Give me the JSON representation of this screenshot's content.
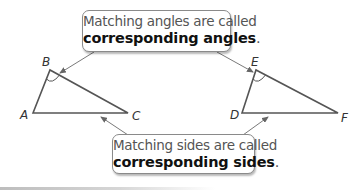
{
  "callouts": {
    "angles": {
      "line1": "Matching angles are called",
      "term": "corresponding angles",
      "punct": "."
    },
    "sides": {
      "line1": "Matching sides are called",
      "term": "corresponding sides",
      "punct": "."
    }
  },
  "triangles": [
    {
      "name": "ABC",
      "vertices": [
        {
          "label": "A",
          "x": 33,
          "y": 113
        },
        {
          "label": "B",
          "x": 50,
          "y": 70
        },
        {
          "label": "C",
          "x": 128,
          "y": 113
        }
      ],
      "marked_angle": "B"
    },
    {
      "name": "DEF",
      "vertices": [
        {
          "label": "D",
          "x": 242,
          "y": 113
        },
        {
          "label": "E",
          "x": 256,
          "y": 70
        },
        {
          "label": "F",
          "x": 338,
          "y": 113
        }
      ],
      "marked_angle": "E"
    }
  ],
  "labels": {
    "A": "A",
    "B": "B",
    "C": "C",
    "D": "D",
    "E": "E",
    "F": "F"
  },
  "colors": {
    "line": "#555555",
    "arrow": "#6a6a6a",
    "callout_border": "#8a8a8a",
    "bold_text": "#111111",
    "plain_text": "#555555"
  }
}
